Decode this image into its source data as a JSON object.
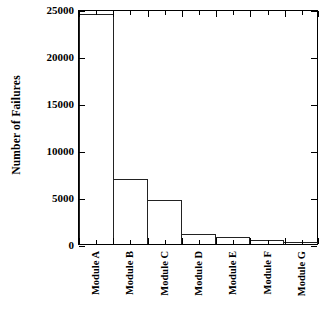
{
  "chart_data": {
    "type": "bar",
    "title": "",
    "xlabel": "",
    "ylabel": "Number of Failures",
    "categories": [
      "Module A",
      "Module B",
      "Module C",
      "Module D",
      "Module E",
      "Module F",
      "Module G"
    ],
    "values": [
      24700,
      7000,
      4700,
      1100,
      700,
      450,
      250
    ],
    "ylim": [
      0,
      25000
    ],
    "yticks": [
      0,
      5000,
      10000,
      15000,
      20000,
      25000
    ],
    "ytick_labels": [
      "0",
      "5000",
      "10000",
      "15000",
      "20000",
      "25000"
    ],
    "grid": false,
    "legend": null,
    "bar_style": {
      "fill": "none",
      "edge_color": "#222222"
    },
    "axes_color": "#000000",
    "background": "#ffffff"
  }
}
